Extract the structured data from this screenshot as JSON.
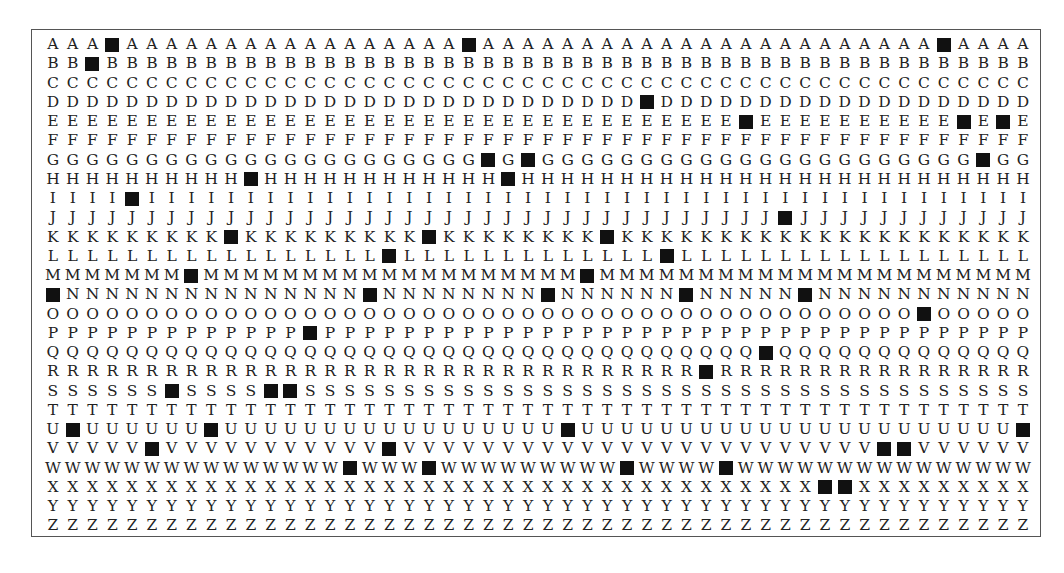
{
  "grid": {
    "columns": 50,
    "block_color": "#111111",
    "rows": [
      {
        "letter": "A",
        "blocks": [
          3,
          21,
          45
        ]
      },
      {
        "letter": "B",
        "blocks": [
          2
        ]
      },
      {
        "letter": "C",
        "blocks": []
      },
      {
        "letter": "D",
        "blocks": [
          30
        ]
      },
      {
        "letter": "E",
        "blocks": [
          35,
          46,
          48
        ]
      },
      {
        "letter": "F",
        "blocks": []
      },
      {
        "letter": "G",
        "blocks": [
          22,
          24,
          47
        ]
      },
      {
        "letter": "H",
        "blocks": [
          10,
          23
        ]
      },
      {
        "letter": "I",
        "blocks": [
          4
        ]
      },
      {
        "letter": "J",
        "blocks": [
          37
        ]
      },
      {
        "letter": "K",
        "blocks": [
          9,
          19,
          28
        ]
      },
      {
        "letter": "L",
        "blocks": [
          17,
          31
        ]
      },
      {
        "letter": "M",
        "blocks": [
          7,
          27
        ]
      },
      {
        "letter": "N",
        "blocks": [
          0,
          16,
          25,
          32,
          38
        ]
      },
      {
        "letter": "O",
        "blocks": [
          44
        ]
      },
      {
        "letter": "P",
        "blocks": [
          13
        ]
      },
      {
        "letter": "Q",
        "blocks": [
          36
        ]
      },
      {
        "letter": "R",
        "blocks": [
          33
        ]
      },
      {
        "letter": "S",
        "blocks": [
          6,
          11,
          12
        ]
      },
      {
        "letter": "T",
        "blocks": []
      },
      {
        "letter": "U",
        "blocks": [
          1,
          8,
          26,
          49
        ]
      },
      {
        "letter": "V",
        "blocks": [
          5,
          17,
          42,
          43
        ]
      },
      {
        "letter": "W",
        "blocks": [
          15,
          19,
          29,
          34
        ]
      },
      {
        "letter": "X",
        "blocks": [
          39,
          40
        ]
      },
      {
        "letter": "Y",
        "blocks": []
      },
      {
        "letter": "Z",
        "blocks": []
      }
    ]
  }
}
